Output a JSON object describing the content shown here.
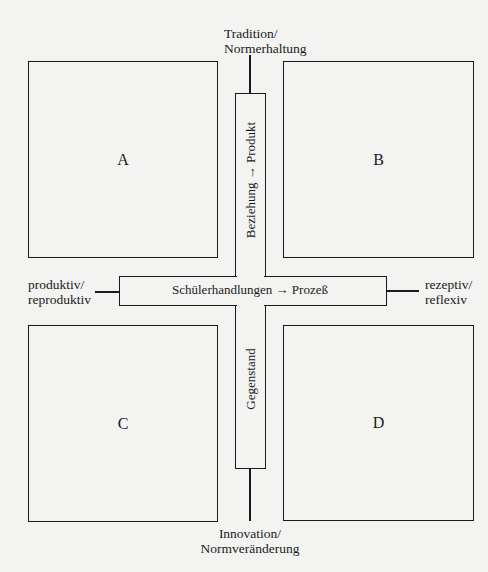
{
  "diagram": {
    "axes": {
      "top": {
        "line1": "Tradition/",
        "line2": "Normerhaltung"
      },
      "bottom": {
        "line1": "Innovation/",
        "line2": "Normveränderung"
      },
      "left": {
        "line1": "produktiv/",
        "line2": "reproduktiv"
      },
      "right": {
        "line1": "rezeptiv/",
        "line2": "reflexiv"
      }
    },
    "horizontal_bar": {
      "label": "Schülerhandlungen → Prozeß"
    },
    "vertical_bar": {
      "upper_label": "Beziehung → Produkt",
      "lower_label": "Gegenstand"
    },
    "quadrants": [
      {
        "id": "A",
        "label": "A"
      },
      {
        "id": "B",
        "label": "B"
      },
      {
        "id": "C",
        "label": "C"
      },
      {
        "id": "D",
        "label": "D"
      }
    ]
  }
}
